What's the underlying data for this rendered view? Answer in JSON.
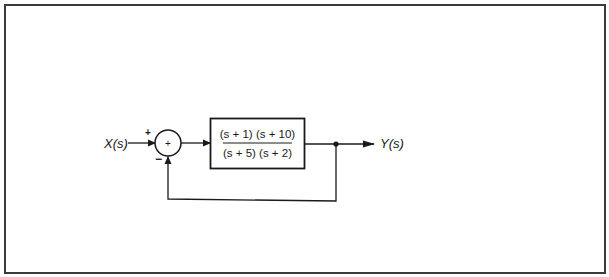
{
  "diagram": {
    "type": "feedback-control-block-diagram",
    "input": {
      "label": "X(s)"
    },
    "output": {
      "label": "Y(s)"
    },
    "summing_junction": {
      "center_symbol": "+",
      "input_signs": {
        "reference": "+",
        "feedback": "−"
      }
    },
    "forward_block": {
      "numerator": "(s + 1) (s + 10)",
      "denominator": "(s + 5) (s + 2)"
    },
    "feedback_path": {
      "type": "unity"
    },
    "colors": {
      "line": "#1a1a1a",
      "frame": "#3a3a3a",
      "background": "#ffffff"
    }
  }
}
